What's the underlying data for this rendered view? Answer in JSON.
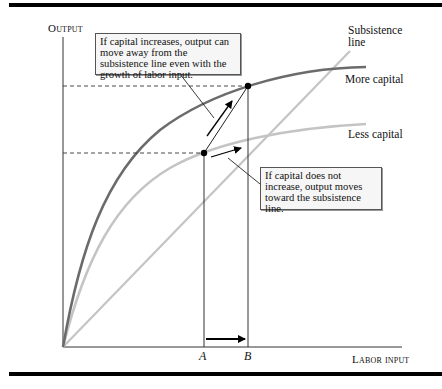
{
  "axes": {
    "y_label": "Output",
    "x_label": "Labor input"
  },
  "curves": {
    "more_capital": {
      "label": "More capital",
      "color": "#6b6b6b"
    },
    "less_capital": {
      "label": "Less capital",
      "color": "#c4c4c4"
    },
    "subsistence": {
      "label": "Subsistence line",
      "color": "#c4c4c4"
    }
  },
  "points": {
    "a_label": "A",
    "b_label": "B"
  },
  "callouts": {
    "capital_increase": "If capital increases, output can move away from the subsistence line even with the growth of labor input.",
    "capital_constant": "If capital does not increase, output moves toward the subsistence line."
  },
  "colors": {
    "rule": "#000000",
    "axis": "#333333",
    "callout_bg": "#f6f6f6"
  }
}
